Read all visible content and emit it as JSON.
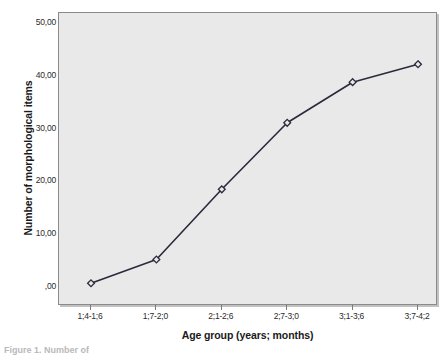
{
  "figure": {
    "caption": "Figure 1. Number of"
  },
  "chart_data": {
    "type": "line",
    "title": "",
    "xlabel": "Age group (years; months)",
    "ylabel": "Number of morphological items",
    "categories": [
      "1;4-1;6",
      "1;7-2;0",
      "2;1-2;6",
      "2;7-3;0",
      "3;1-3;6",
      "3;7-4;2"
    ],
    "values": [
      0.8,
      5.3,
      18.6,
      31.2,
      38.9,
      42.3
    ],
    "series": [
      {
        "name": "Number of morphological items",
        "values": [
          0.8,
          5.3,
          18.6,
          31.2,
          38.9,
          42.3
        ]
      }
    ],
    "ylim": [
      -3.5,
      52.0
    ],
    "yticks": [
      0,
      10,
      20,
      30,
      40,
      50
    ],
    "ytick_labels": [
      ",00",
      "10,00",
      "20,00",
      "30,00",
      "40,00",
      "50,00"
    ],
    "grid": false,
    "legend": "none",
    "marker": "diamond",
    "line_color": "#2a2a3c",
    "plot_background": "#e9e9e9",
    "frame_color": "#8a8a8a"
  }
}
